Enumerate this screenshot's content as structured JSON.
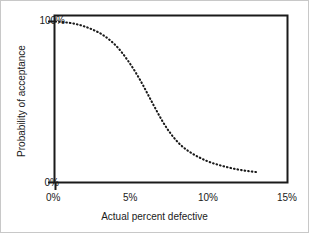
{
  "chart_data": {
    "type": "line",
    "title": "",
    "subtitle": "",
    "xlabel": "Actual percent defective",
    "ylabel": "Probability of acceptance",
    "xlim": [
      0,
      15
    ],
    "ylim": [
      0,
      100
    ],
    "xticks": [
      0,
      5,
      10,
      15
    ],
    "xticklabels": [
      "0%",
      "5%",
      "10%",
      "15%"
    ],
    "yticks": [
      0,
      100
    ],
    "yticklabels": [
      "0%",
      "100%"
    ],
    "grid": false,
    "legend": null,
    "linestyle": "dotted",
    "color": "#1a1a1a",
    "series": [
      {
        "name": "Operating characteristic curve",
        "x": [
          0.0,
          0.5,
          1.0,
          1.5,
          2.0,
          2.5,
          3.0,
          3.5,
          4.0,
          4.5,
          5.0,
          5.5,
          6.0,
          6.5,
          7.0,
          7.5,
          8.0,
          8.5,
          9.0,
          9.5,
          10.0,
          10.5,
          11.0,
          11.5,
          12.0,
          12.5,
          13.0
        ],
        "y": [
          100.0,
          99.6,
          99.0,
          98.0,
          96.5,
          94.5,
          92.0,
          88.5,
          84.0,
          78.0,
          71.0,
          63.0,
          54.0,
          45.0,
          36.5,
          29.5,
          24.0,
          20.0,
          17.0,
          14.5,
          12.5,
          11.0,
          9.7,
          8.6,
          7.7,
          7.0,
          6.4
        ]
      }
    ]
  },
  "axes": {
    "tick_labels": {
      "y_top": "100%",
      "y_bottom": "0%",
      "x_0": "0%",
      "x_5": "5%",
      "x_10": "10%",
      "x_15": "15%"
    },
    "x_title": "Actual percent defective",
    "y_title": "Probability of acceptance"
  },
  "style": {
    "frame_color": "#1a1a1a",
    "curve_color": "#1a1a1a",
    "background": "#ffffff",
    "border_color": "#c8c8c8"
  }
}
